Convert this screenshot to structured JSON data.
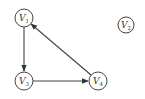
{
  "graph": {
    "type": "directed",
    "nodes": [
      {
        "id": "V1",
        "base": "V",
        "sub": "1",
        "x": 24,
        "y": 18
      },
      {
        "id": "V2",
        "base": "V",
        "sub": "2",
        "x": 126,
        "y": 25
      },
      {
        "id": "V3",
        "base": "V",
        "sub": "3",
        "x": 24,
        "y": 81
      },
      {
        "id": "V4",
        "base": "V",
        "sub": "4",
        "x": 98,
        "y": 81
      }
    ],
    "edges": [
      {
        "from": "V1",
        "to": "V3"
      },
      {
        "from": "V3",
        "to": "V4"
      },
      {
        "from": "V4",
        "to": "V1"
      }
    ],
    "colors": {
      "stroke": "#444444",
      "text": "#333333",
      "background": "#ffffff"
    }
  }
}
